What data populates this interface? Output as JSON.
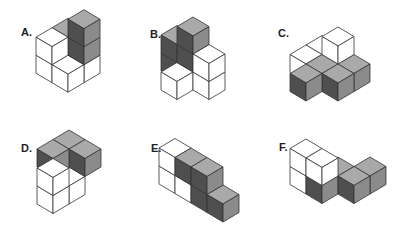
{
  "colors": {
    "white": {
      "top": "#ffffff",
      "left": "#ffffff",
      "right": "#ffffff"
    },
    "grey": {
      "top": "#a9a9a9",
      "left": "#4f4f4f",
      "right": "#8b8b8b"
    },
    "stroke": "#333333"
  },
  "geometry": {
    "dx": 16,
    "dy": 9.5,
    "h": 18
  },
  "figures": [
    {
      "label": "A.",
      "label_pos": [
        21,
        27
      ],
      "origin": [
        68,
        54.2
      ],
      "cubes": [
        [
          0,
          0,
          0,
          "grey"
        ],
        [
          0,
          0,
          1,
          "grey"
        ],
        [
          1,
          0,
          0,
          "white"
        ],
        [
          1,
          0,
          1,
          "grey"
        ],
        [
          1,
          0,
          2,
          "grey"
        ],
        [
          0,
          1,
          0,
          "white"
        ],
        [
          0,
          1,
          1,
          "white"
        ],
        [
          1,
          1,
          0,
          "white"
        ]
      ]
    },
    {
      "label": "B.",
      "label_pos": [
        150,
        29
      ],
      "origin": [
        177,
        61.5
      ],
      "cubes": [
        [
          0,
          0,
          0,
          "grey"
        ],
        [
          0,
          0,
          1,
          "grey"
        ],
        [
          1,
          0,
          0,
          "grey"
        ],
        [
          1,
          0,
          1,
          "grey"
        ],
        [
          1,
          0,
          2,
          "grey"
        ],
        [
          1,
          1,
          0,
          "white"
        ],
        [
          2,
          0,
          0,
          "white"
        ],
        [
          2,
          0,
          1,
          "white"
        ]
      ]
    },
    {
      "label": "C.",
      "label_pos": [
        278,
        28
      ],
      "origin": [
        338,
        63
      ],
      "cubes": [
        [
          -1,
          0,
          0,
          "white"
        ],
        [
          -1,
          1,
          0,
          "white"
        ],
        [
          0,
          0,
          0,
          "white"
        ],
        [
          0,
          0,
          1,
          "white"
        ],
        [
          1,
          0,
          0,
          "grey"
        ],
        [
          0,
          1,
          0,
          "grey"
        ],
        [
          1,
          1,
          0,
          "grey"
        ],
        [
          0,
          2,
          0,
          "grey"
        ]
      ]
    },
    {
      "label": "D.",
      "label_pos": [
        21,
        143
      ],
      "origin": [
        53,
        175.5
      ],
      "cubes": [
        [
          0,
          -1,
          1,
          "grey"
        ],
        [
          1,
          -1,
          1,
          "grey"
        ],
        [
          0,
          0,
          1,
          "grey"
        ],
        [
          1,
          0,
          0,
          "white"
        ],
        [
          1,
          1,
          0,
          "white"
        ],
        [
          1,
          1,
          1,
          "white"
        ]
      ]
    },
    {
      "label": "E.",
      "label_pos": [
        151,
        143
      ],
      "origin": [
        175,
        174.5
      ],
      "cubes": [
        [
          0,
          0,
          0,
          "white"
        ],
        [
          0,
          0,
          1,
          "white"
        ],
        [
          1,
          0,
          0,
          "white"
        ],
        [
          1,
          0,
          1,
          "grey"
        ],
        [
          2,
          0,
          0,
          "grey"
        ],
        [
          2,
          0,
          1,
          "grey"
        ],
        [
          3,
          0,
          0,
          "grey"
        ]
      ]
    },
    {
      "label": "F.",
      "label_pos": [
        279,
        142
      ],
      "origin": [
        306,
        175
      ],
      "cubes": [
        [
          0,
          0,
          0,
          "white"
        ],
        [
          0,
          0,
          1,
          "white"
        ],
        [
          1,
          0,
          0,
          "grey"
        ],
        [
          1,
          0,
          1,
          "white"
        ],
        [
          1,
          -1,
          0,
          "grey"
        ],
        [
          2,
          -2,
          0,
          "grey"
        ],
        [
          2,
          -1,
          0,
          "grey"
        ]
      ]
    }
  ]
}
